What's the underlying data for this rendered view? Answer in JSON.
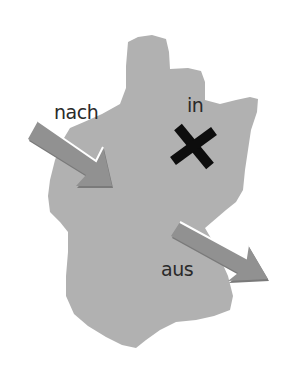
{
  "diagram": {
    "title": "",
    "map_region": "country-outline",
    "labels": {
      "nach": "nach",
      "in": "in",
      "aus": "aus"
    },
    "markers": [
      {
        "name": "nach",
        "type": "arrow-pointing-into-map",
        "direction": "down-right"
      },
      {
        "name": "in",
        "type": "x-mark-inside-map"
      },
      {
        "name": "aus",
        "type": "arrow-pointing-out-of-map",
        "direction": "down-right"
      }
    ],
    "colors": {
      "map_fill": "#b1b1b1",
      "arrow_fill": "#8e8e8e",
      "arrow_shadow": "#6f6f6f",
      "x_mark": "#0d0d0d",
      "text": "#2a2a2a",
      "background": "#ffffff"
    }
  }
}
